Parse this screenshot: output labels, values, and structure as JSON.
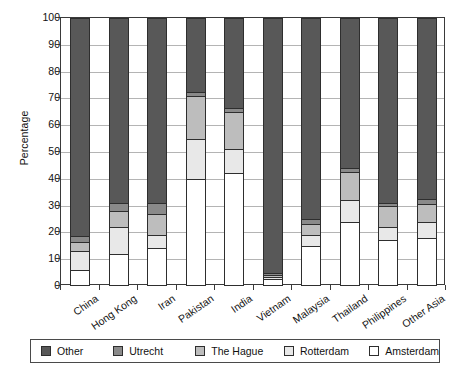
{
  "chart_data": {
    "type": "bar",
    "subtype": "stacked-bar-100",
    "title": "",
    "xlabel": "",
    "ylabel": "Percentage",
    "ylim": [
      0,
      100
    ],
    "yticks": [
      0,
      10,
      20,
      30,
      40,
      50,
      60,
      70,
      80,
      90,
      100
    ],
    "ytick_labels": [
      "0",
      "10",
      "20",
      "30",
      "40",
      "50",
      "60",
      "70",
      "80",
      "90",
      "100"
    ],
    "grid": true,
    "legend_position": "bottom",
    "legend_entries": [
      "Other",
      "Utrecht",
      "The Hague",
      "Rotterdam",
      "Amsterdam"
    ],
    "categories": [
      "China",
      "Hong Kong",
      "Iran",
      "Pakistan",
      "India",
      "Vietnam",
      "Malaysia",
      "Thailand",
      "Philippines",
      "Other Asia"
    ],
    "series": [
      {
        "name": "Amsterdam",
        "color": "#ffffff",
        "values": [
          6,
          12,
          14,
          40,
          42,
          2.5,
          15,
          24,
          17,
          18
        ]
      },
      {
        "name": "Rotterdam",
        "color": "#e8e8e8",
        "values": [
          7,
          10,
          5,
          15,
          9,
          1,
          4,
          8,
          5,
          6
        ]
      },
      {
        "name": "The Hague",
        "color": "#bdbdbd",
        "values": [
          3.5,
          6,
          8,
          16,
          14,
          0.5,
          4,
          10.5,
          8,
          6.5
        ]
      },
      {
        "name": "Utrecht",
        "color": "#8a8a8a",
        "values": [
          2,
          3,
          4,
          1.5,
          1.5,
          1,
          2,
          1.5,
          1,
          2
        ]
      },
      {
        "name": "Other",
        "color": "#585858",
        "values": [
          81.5,
          69,
          69,
          27.5,
          33.5,
          95,
          75,
          56,
          69,
          67.5
        ]
      }
    ],
    "cumulative_tops": {
      "China": {
        "Amsterdam": 6,
        "Rotterdam": 13,
        "The Hague": 16.5,
        "Utrecht": 18.5,
        "Other": 100
      },
      "Hong Kong": {
        "Amsterdam": 12,
        "Rotterdam": 22,
        "The Hague": 28,
        "Utrecht": 31,
        "Other": 100
      },
      "Iran": {
        "Amsterdam": 14,
        "Rotterdam": 19,
        "The Hague": 27,
        "Utrecht": 31,
        "Other": 100
      },
      "Pakistan": {
        "Amsterdam": 40,
        "Rotterdam": 55,
        "The Hague": 71,
        "Utrecht": 72.5,
        "Other": 100
      },
      "India": {
        "Amsterdam": 42,
        "Rotterdam": 51,
        "The Hague": 65,
        "Utrecht": 66.5,
        "Other": 100
      },
      "Vietnam": {
        "Amsterdam": 2.5,
        "Rotterdam": 3.5,
        "The Hague": 4,
        "Utrecht": 5,
        "Other": 100
      },
      "Malaysia": {
        "Amsterdam": 15,
        "Rotterdam": 19,
        "The Hague": 23,
        "Utrecht": 25,
        "Other": 100
      },
      "Thailand": {
        "Amsterdam": 24,
        "Rotterdam": 32,
        "The Hague": 42.5,
        "Utrecht": 44,
        "Other": 100
      },
      "Philippines": {
        "Amsterdam": 17,
        "Rotterdam": 22,
        "The Hague": 30,
        "Utrecht": 31,
        "Other": 100
      },
      "Other Asia": {
        "Amsterdam": 18,
        "Rotterdam": 24,
        "The Hague": 30.5,
        "Utrecht": 32.5,
        "Other": 100
      }
    }
  },
  "colors": {
    "other": "#585858",
    "utrecht": "#8a8a8a",
    "the_hague": "#bdbdbd",
    "rotterdam": "#e8e8e8",
    "amsterdam": "#ffffff",
    "axis": "#3a3a3a",
    "grid": "#b4b4b4",
    "text": "#111111"
  }
}
